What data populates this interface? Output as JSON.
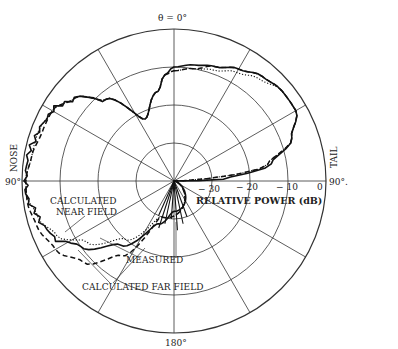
{
  "chart_data": {
    "type": "polar-line",
    "title": "",
    "angle_labels": {
      "top": "θ = 0°",
      "left": "90°",
      "right": "90°.",
      "bottom": "180°"
    },
    "side_labels": {
      "left": "NOSE",
      "right": "TAIL"
    },
    "radial_axis": {
      "label": "RELATIVE POWER (dB)",
      "ticks": [
        "− 30",
        "− 20",
        "− 10",
        "0"
      ],
      "tick_values": [
        -30,
        -20,
        -10,
        0
      ],
      "range": [
        -40,
        0
      ]
    },
    "angular_grid_step_deg": 30,
    "angle_convention": "degrees clockwise from top (0° = top, 90° right = tail side, 270° left = nose side, 180° bottom)",
    "series": [
      {
        "name": "MEASURED",
        "style": "solid",
        "points": [
          [
            0,
            -10
          ],
          [
            10,
            -9
          ],
          [
            20,
            -8
          ],
          [
            30,
            -6
          ],
          [
            40,
            -4
          ],
          [
            50,
            -3
          ],
          [
            60,
            -3
          ],
          [
            70,
            -7
          ],
          [
            80,
            -14
          ],
          [
            88,
            -27
          ],
          [
            90,
            -40
          ],
          [
            180,
            -32
          ],
          [
            200,
            -28
          ],
          [
            220,
            -18
          ],
          [
            235,
            -10
          ],
          [
            245,
            -5
          ],
          [
            255,
            -3
          ],
          [
            265,
            -1
          ],
          [
            270,
            -1
          ],
          [
            280,
            -1
          ],
          [
            290,
            -2
          ],
          [
            300,
            -3
          ],
          [
            310,
            -6
          ],
          [
            320,
            -12
          ],
          [
            335,
            -22
          ],
          [
            350,
            -16
          ],
          [
            355,
            -12
          ]
        ]
      },
      {
        "name": "CALCULATED NEAR FIELD",
        "style": "dotted",
        "points": [
          [
            0,
            -11
          ],
          [
            10,
            -10
          ],
          [
            20,
            -9
          ],
          [
            30,
            -7
          ],
          [
            40,
            -5
          ],
          [
            50,
            -3
          ],
          [
            60,
            -3
          ],
          [
            70,
            -7
          ],
          [
            80,
            -15
          ],
          [
            90,
            -40
          ],
          [
            200,
            -30
          ],
          [
            220,
            -20
          ],
          [
            235,
            -12
          ],
          [
            245,
            -6
          ],
          [
            255,
            -3
          ],
          [
            265,
            -1
          ],
          [
            270,
            -1
          ],
          [
            280,
            -2
          ],
          [
            290,
            -2
          ],
          [
            300,
            -3
          ],
          [
            310,
            -6
          ],
          [
            320,
            -12
          ],
          [
            335,
            -22
          ],
          [
            350,
            -16
          ],
          [
            355,
            -12
          ]
        ]
      },
      {
        "name": "CALCULATED FAR FIELD",
        "style": "dashed",
        "points": [
          [
            0,
            -11
          ],
          [
            10,
            -10
          ],
          [
            20,
            -8
          ],
          [
            30,
            -6
          ],
          [
            40,
            -4
          ],
          [
            50,
            -3
          ],
          [
            60,
            -3
          ],
          [
            70,
            -7
          ],
          [
            80,
            -15
          ],
          [
            90,
            -40
          ],
          [
            200,
            -30
          ],
          [
            215,
            -16
          ],
          [
            228,
            -8
          ],
          [
            240,
            -4
          ],
          [
            252,
            -2
          ],
          [
            262,
            -1
          ],
          [
            270,
            -1
          ],
          [
            280,
            -2
          ],
          [
            290,
            -3
          ],
          [
            300,
            -3
          ],
          [
            310,
            -6
          ],
          [
            320,
            -12
          ],
          [
            335,
            -22
          ],
          [
            350,
            -16
          ],
          [
            355,
            -12
          ]
        ]
      }
    ],
    "annotations": [
      "CALCULATED NEAR FIELD",
      "MEASURED",
      "CALCULATED FAR FIELD"
    ]
  },
  "labels": {
    "theta_top": "θ = 0°",
    "left_angle": "90°",
    "right_angle": "90°.",
    "bottom_angle": "180°",
    "nose": "NOSE",
    "tail": "TAIL",
    "tick_m30": "− 30",
    "tick_m20": "− 20",
    "tick_m10": "− 10",
    "tick_0": "0",
    "axis_label": "RELATIVE POWER (dB)",
    "near_field_1": "CALCULATED",
    "near_field_2": "NEAR FIELD",
    "measured": "MEASURED",
    "far_field": "CALCULATED FAR FIELD"
  }
}
